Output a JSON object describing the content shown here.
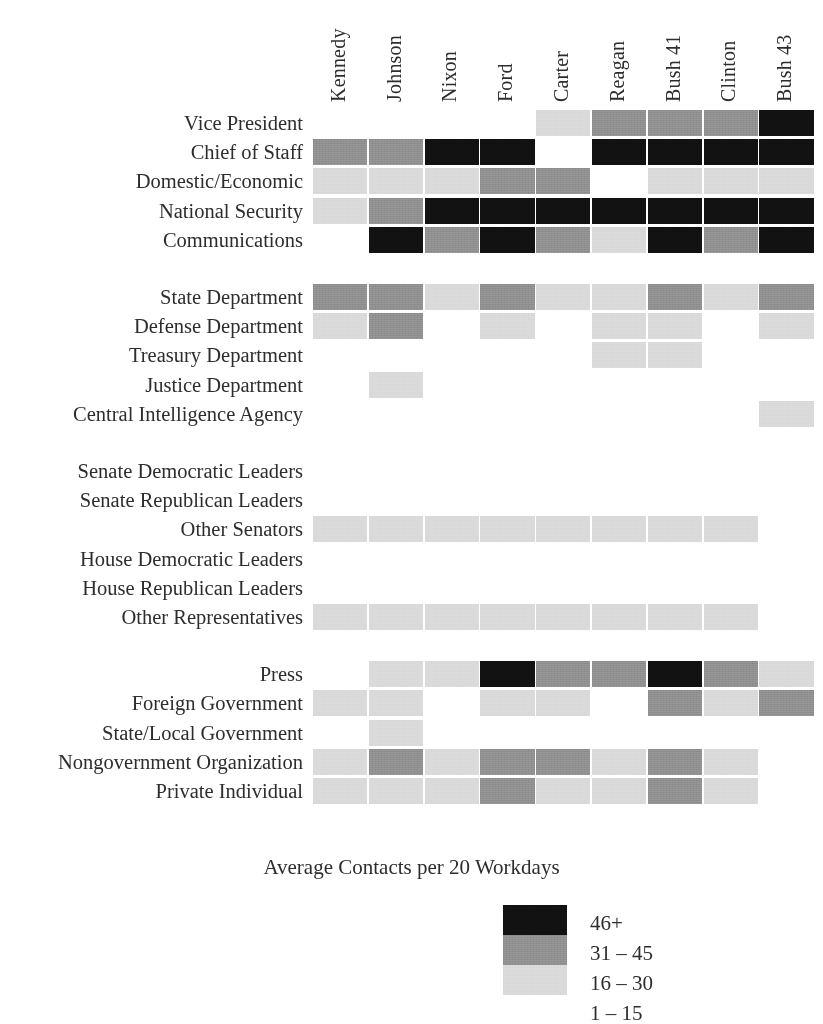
{
  "chart_data": {
    "type": "heatmap",
    "title": "",
    "legend_title": "Average Contacts per 20 Workdays",
    "legend_position": "bottom-center",
    "xlabel": "",
    "ylabel": "",
    "grid": false,
    "categories": [
      "Kennedy",
      "Johnson",
      "Nixon",
      "Ford",
      "Carter",
      "Reagan",
      "Bush 41",
      "Clinton",
      "Bush 43"
    ],
    "levels": [
      {
        "index": 0,
        "label": "1 – 15",
        "color": "#ffffff"
      },
      {
        "index": 1,
        "label": "16 – 30",
        "color": "#d9d9d9"
      },
      {
        "index": 2,
        "label": "31 – 45",
        "color": "#8f8f8f"
      },
      {
        "index": 3,
        "label": "46+",
        "color": "#111111"
      }
    ],
    "legend_entries": [
      "46+",
      "31 – 45",
      "16 – 30",
      "1 – 15"
    ],
    "groups": [
      {
        "name": "White House Staff",
        "rows": [
          {
            "label": "Vice President",
            "values": [
              null,
              null,
              null,
              null,
              1,
              2,
              2,
              2,
              3
            ]
          },
          {
            "label": "Chief of Staff",
            "values": [
              2,
              2,
              3,
              3,
              0,
              3,
              3,
              3,
              3
            ]
          },
          {
            "label": "Domestic/Economic",
            "values": [
              1,
              1,
              1,
              2,
              2,
              0,
              1,
              1,
              1
            ]
          },
          {
            "label": "National Security",
            "values": [
              1,
              2,
              3,
              3,
              3,
              3,
              3,
              3,
              3
            ]
          },
          {
            "label": "Communications",
            "values": [
              null,
              3,
              2,
              3,
              2,
              1,
              3,
              2,
              3
            ]
          }
        ]
      },
      {
        "name": "Departments and Agencies",
        "rows": [
          {
            "label": "State Department",
            "values": [
              2,
              2,
              1,
              2,
              1,
              1,
              2,
              1,
              2
            ]
          },
          {
            "label": "Defense Department",
            "values": [
              1,
              2,
              null,
              1,
              null,
              1,
              1,
              null,
              1
            ]
          },
          {
            "label": "Treasury Department",
            "values": [
              null,
              null,
              null,
              null,
              null,
              1,
              1,
              null,
              null
            ]
          },
          {
            "label": "Justice Department",
            "values": [
              null,
              1,
              null,
              null,
              null,
              null,
              null,
              null,
              null
            ]
          },
          {
            "label": "Central Intelligence Agency",
            "values": [
              null,
              null,
              null,
              null,
              null,
              null,
              null,
              null,
              1
            ]
          }
        ]
      },
      {
        "name": "Congress",
        "rows": [
          {
            "label": "Senate Democratic Leaders",
            "values": [
              null,
              null,
              null,
              null,
              null,
              null,
              null,
              null,
              null
            ]
          },
          {
            "label": "Senate Republican Leaders",
            "values": [
              null,
              null,
              null,
              null,
              null,
              null,
              null,
              null,
              null
            ]
          },
          {
            "label": "Other Senators",
            "values": [
              1,
              1,
              1,
              1,
              1,
              1,
              1,
              1,
              null
            ]
          },
          {
            "label": "House Democratic Leaders",
            "values": [
              null,
              null,
              null,
              null,
              null,
              null,
              null,
              null,
              null
            ]
          },
          {
            "label": "House Republican Leaders",
            "values": [
              null,
              null,
              null,
              null,
              null,
              null,
              null,
              null,
              null
            ]
          },
          {
            "label": "Other Representatives",
            "values": [
              1,
              1,
              1,
              1,
              1,
              1,
              1,
              1,
              null
            ]
          }
        ]
      },
      {
        "name": "Outside Government",
        "rows": [
          {
            "label": "Press",
            "values": [
              null,
              1,
              1,
              3,
              2,
              2,
              3,
              2,
              1
            ]
          },
          {
            "label": "Foreign Government",
            "values": [
              1,
              1,
              null,
              1,
              1,
              null,
              2,
              1,
              2
            ]
          },
          {
            "label": "State/Local Government",
            "values": [
              null,
              1,
              null,
              null,
              null,
              null,
              null,
              null,
              null
            ]
          },
          {
            "label": "Nongovernment Organization",
            "values": [
              1,
              2,
              1,
              2,
              2,
              1,
              2,
              1,
              null
            ]
          },
          {
            "label": "Private Individual",
            "values": [
              1,
              1,
              1,
              2,
              1,
              1,
              2,
              1,
              null
            ]
          }
        ]
      }
    ]
  }
}
